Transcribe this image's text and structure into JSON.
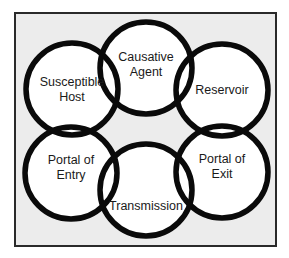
{
  "diagram": {
    "colors": {
      "background": "#ffffff",
      "frame_fill": "#ececec",
      "frame_border": "#2a2a2a",
      "circle_fill": "#ffffff",
      "circle_stroke": "#0a0a0a",
      "text": "#1a1a1a"
    },
    "nodes": [
      {
        "id": "causative-agent",
        "lines": [
          "Causative",
          "Agent"
        ],
        "position": "top"
      },
      {
        "id": "reservoir",
        "lines": [
          "Reservoir"
        ],
        "position": "upper-right"
      },
      {
        "id": "portal-of-exit",
        "lines": [
          "Portal of",
          "Exit"
        ],
        "position": "lower-right"
      },
      {
        "id": "transmission",
        "lines": [
          "Transmission"
        ],
        "position": "bottom"
      },
      {
        "id": "portal-of-entry",
        "lines": [
          "Portal of",
          "Entry"
        ],
        "position": "lower-left"
      },
      {
        "id": "susceptible-host",
        "lines": [
          "Susceptible",
          "Host"
        ],
        "position": "upper-left"
      }
    ]
  }
}
